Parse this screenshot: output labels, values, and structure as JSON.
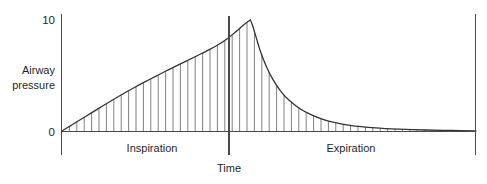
{
  "figure": {
    "title": "",
    "background_color": "#ffffff",
    "line_color": "#333333",
    "axis_color": "#4a4a4a",
    "hatch_color": "#6a6a6a"
  },
  "labels": {
    "y_axis_title_line1": "Airway",
    "y_axis_title_line2": "pressure",
    "x_axis_title": "Time",
    "phase_inspiration": "Inspiration",
    "phase_expiration": "Expiration",
    "y_tick_top": "10",
    "y_tick_bottom": "0"
  },
  "chart_data": {
    "type": "line",
    "title": "",
    "xlabel": "Time",
    "ylabel": "Airway pressure",
    "ylim": [
      0,
      10
    ],
    "yticks": [
      0,
      10
    ],
    "ytick_labels": [
      "0",
      "10"
    ],
    "xticks": [],
    "xtick_labels": [],
    "grid": false,
    "legend": "none",
    "annotations": [
      {
        "text": "Inspiration",
        "region": "left-of-divider"
      },
      {
        "text": "Expiration",
        "region": "right-of-divider"
      },
      {
        "text": "Time",
        "region": "below-divider"
      }
    ],
    "phase_boundary_x": 0.455,
    "fill_style": "vertical-hatching",
    "series": [
      {
        "name": "Airway pressure",
        "x": [
          0.0,
          0.02,
          0.04,
          0.06,
          0.08,
          0.1,
          0.125,
          0.15,
          0.175,
          0.2,
          0.225,
          0.25,
          0.275,
          0.3,
          0.325,
          0.35,
          0.375,
          0.4,
          0.42,
          0.44,
          0.455,
          0.46,
          0.47,
          0.48,
          0.495,
          0.51,
          0.53,
          0.55,
          0.575,
          0.6,
          0.63,
          0.66,
          0.7,
          0.74,
          0.78,
          0.83,
          0.88,
          0.94,
          1.0
        ],
        "y": [
          0.0,
          0.46,
          0.92,
          1.38,
          1.84,
          2.3,
          2.86,
          3.4,
          3.92,
          4.42,
          4.9,
          5.38,
          5.84,
          6.3,
          6.76,
          7.22,
          7.72,
          8.34,
          8.95,
          9.6,
          10.0,
          9.55,
          8.3,
          7.1,
          5.7,
          4.6,
          3.5,
          2.72,
          2.0,
          1.5,
          1.05,
          0.75,
          0.48,
          0.32,
          0.22,
          0.14,
          0.09,
          0.05,
          0.02
        ]
      }
    ]
  }
}
